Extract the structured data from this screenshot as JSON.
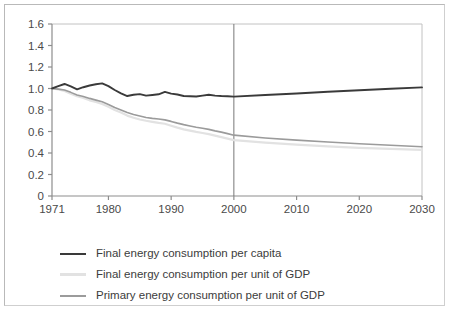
{
  "chart_data": {
    "type": "line",
    "title": "",
    "xlabel": "",
    "ylabel": "",
    "xlim": [
      1971,
      2030
    ],
    "ylim": [
      0,
      1.6
    ],
    "grid": false,
    "legend_position": "below",
    "y_ticks": [
      "1.6",
      "1.4",
      "1.2",
      "1.0",
      "0.8",
      "0.6",
      "0.4",
      "0.2",
      "0"
    ],
    "y_tick_values": [
      1.6,
      1.4,
      1.2,
      1.0,
      0.8,
      0.6,
      0.4,
      0.2,
      0
    ],
    "x_ticks": [
      "1971",
      "1980",
      "1990",
      "2000",
      "2010",
      "2020",
      "2030"
    ],
    "x_tick_values": [
      1971,
      1980,
      1990,
      2000,
      2010,
      2020,
      2030
    ],
    "annotations": [
      {
        "type": "vertical-line",
        "x": 2000,
        "label": "projection-divider"
      }
    ],
    "x": [
      1971,
      1972,
      1973,
      1974,
      1975,
      1976,
      1977,
      1978,
      1979,
      1980,
      1981,
      1982,
      1983,
      1984,
      1985,
      1986,
      1987,
      1988,
      1989,
      1990,
      1991,
      1992,
      1993,
      1994,
      1995,
      1996,
      1997,
      1998,
      1999,
      2000,
      2005,
      2010,
      2015,
      2020,
      2025,
      2030
    ],
    "series": [
      {
        "name": "Final energy consumption per capita",
        "color": "#3a3a3a",
        "width": 1.9,
        "values": [
          1.0,
          1.022,
          1.042,
          1.02,
          0.992,
          1.012,
          1.028,
          1.04,
          1.048,
          1.022,
          0.986,
          0.955,
          0.93,
          0.942,
          0.948,
          0.934,
          0.94,
          0.946,
          0.968,
          0.952,
          0.944,
          0.93,
          0.928,
          0.926,
          0.934,
          0.942,
          0.934,
          0.93,
          0.928,
          0.924,
          0.94,
          0.954,
          0.97,
          0.984,
          0.998,
          1.01
        ]
      },
      {
        "name": "Final energy consumption per unit of GDP",
        "color": "#e2e2e2",
        "width": 2.2,
        "values": [
          1.0,
          0.992,
          0.978,
          0.952,
          0.928,
          0.912,
          0.89,
          0.874,
          0.856,
          0.83,
          0.8,
          0.776,
          0.748,
          0.728,
          0.712,
          0.7,
          0.69,
          0.68,
          0.672,
          0.654,
          0.636,
          0.62,
          0.608,
          0.596,
          0.586,
          0.576,
          0.562,
          0.548,
          0.534,
          0.52,
          0.496,
          0.478,
          0.462,
          0.448,
          0.438,
          0.43
        ]
      },
      {
        "name": "Primary energy consumption per unit of GDP",
        "color": "#9b9b9b",
        "width": 1.6,
        "values": [
          1.0,
          0.994,
          0.986,
          0.964,
          0.94,
          0.926,
          0.908,
          0.892,
          0.876,
          0.852,
          0.824,
          0.8,
          0.776,
          0.758,
          0.744,
          0.73,
          0.722,
          0.716,
          0.708,
          0.694,
          0.678,
          0.664,
          0.652,
          0.64,
          0.63,
          0.62,
          0.606,
          0.594,
          0.58,
          0.566,
          0.54,
          0.52,
          0.502,
          0.486,
          0.472,
          0.458
        ]
      }
    ]
  },
  "legend": {
    "items": [
      {
        "label": "Final energy consumption per capita",
        "color": "#3a3a3a",
        "width": "2px"
      },
      {
        "label": "Final energy consumption per unit of GDP",
        "color": "#e2e2e2",
        "width": "3px"
      },
      {
        "label": "Primary energy consumption per unit of GDP",
        "color": "#9b9b9b",
        "width": "2px"
      }
    ]
  },
  "axis_color": "#8d8d8d",
  "frame_color": "#b9b9b9"
}
